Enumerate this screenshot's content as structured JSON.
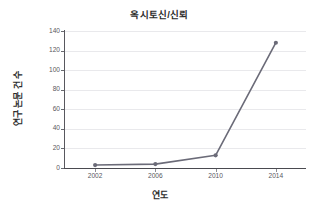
{
  "chart_data": {
    "type": "line",
    "title": "옥시토신/신뢰",
    "xlabel": "연도",
    "ylabel": "연구 논문 건 수",
    "categories": [
      "2002",
      "2006",
      "2010",
      "2014"
    ],
    "x": [
      2002,
      2006,
      2010,
      2014
    ],
    "values": [
      3,
      4,
      13,
      128
    ],
    "series": [
      {
        "name": "옥시토신/신뢰",
        "values": [
          3,
          4,
          13,
          128
        ]
      }
    ],
    "xlim": [
      2000,
      2016
    ],
    "ylim": [
      0,
      140
    ],
    "y_ticks": [
      0,
      20,
      40,
      60,
      80,
      100,
      120,
      140
    ],
    "x_ticks": [
      2002,
      2006,
      2010,
      2014
    ],
    "grid": "horizontal",
    "legend": "none",
    "marker": "circle",
    "line_color": "#6b6b78",
    "marker_color": "#6b6b78",
    "grid_color": "#e9e9ec",
    "axis_color": "#4a4a50",
    "background": "#ffffff"
  }
}
